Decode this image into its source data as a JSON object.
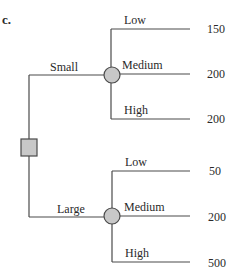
{
  "figure": {
    "part_label": "c.",
    "colors": {
      "line": "#4a4a4a",
      "chance_node_fill": "#c8c8c8",
      "decision_node_fill": "#c8c8c8",
      "text": "#2a2a2a"
    }
  },
  "tree": {
    "decision_node": {
      "shape": "square"
    },
    "decisions": [
      {
        "label": "Small",
        "chance_node": {
          "shape": "circle"
        },
        "outcomes": [
          {
            "label": "Low",
            "payoff": "150"
          },
          {
            "label": "Medium",
            "payoff": "200"
          },
          {
            "label": "High",
            "payoff": "200"
          }
        ]
      },
      {
        "label": "Large",
        "chance_node": {
          "shape": "circle"
        },
        "outcomes": [
          {
            "label": "Low",
            "payoff": "50"
          },
          {
            "label": "Medium",
            "payoff": "200"
          },
          {
            "label": "High",
            "payoff": "500"
          }
        ]
      }
    ]
  }
}
